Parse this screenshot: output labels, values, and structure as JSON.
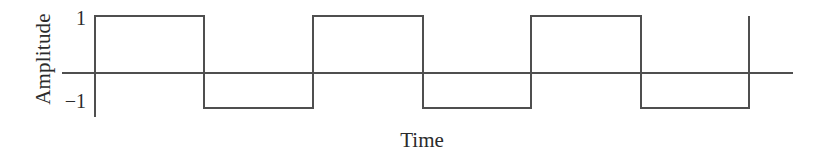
{
  "figure": {
    "background_color": "#ffffff",
    "line_color": "#4f4f4f",
    "text_color": "#2b2b2b",
    "width": 823,
    "height": 159
  },
  "labels": {
    "y_axis_title": "Amplitude",
    "x_axis_title": "Time",
    "tick_pos_one": "1",
    "tick_neg_one": "−1"
  },
  "chart_data": {
    "type": "line",
    "subtype": "square-wave",
    "title": "",
    "xlabel": "Time",
    "ylabel": "Amplitude",
    "xlim": [
      0,
      6.4
    ],
    "ylim": [
      -1.4,
      1.4
    ],
    "grid": false,
    "legend": null,
    "y_tick_values": [
      1,
      -1
    ],
    "y_tick_labels": [
      "1",
      "−1"
    ],
    "x_tick_values": [],
    "x_tick_labels": [],
    "waveform": {
      "amplitude": 1,
      "levels": [
        1,
        -1
      ],
      "period_units": 2,
      "duty_cycle": 0.5,
      "cycles_shown": 3,
      "starts_at_level": 1
    },
    "series": [
      {
        "name": "square wave",
        "color": "#4f4f4f",
        "x": [
          0,
          0,
          1,
          1,
          2,
          2,
          3,
          3,
          4,
          4,
          5,
          5,
          6,
          6
        ],
        "y": [
          -1,
          1,
          1,
          -1,
          -1,
          1,
          1,
          -1,
          -1,
          1,
          1,
          -1,
          -1,
          1
        ]
      }
    ],
    "zero_line": {
      "y": 0,
      "x_start": -0.3,
      "x_end": 6.42
    },
    "y_axis_line": {
      "x": 0,
      "y_start": 1.08,
      "y_end": -1.09
    }
  },
  "geometry": {
    "zero_y_px": 73,
    "top_level_y_px": 16,
    "bottom_level_y_px": 108,
    "axis_x_px": 95,
    "zero_line_x_start_px": 62,
    "zero_line_x_end_px": 793,
    "y_axis_top_px": 15,
    "y_axis_bottom_px": 117,
    "transitions_px": [
      95,
      204,
      313,
      423,
      531,
      641,
      749
    ]
  }
}
